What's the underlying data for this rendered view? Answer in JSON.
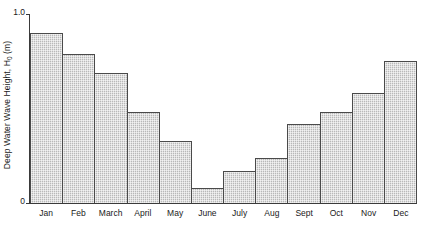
{
  "chart_data": {
    "type": "bar",
    "title": "",
    "xlabel": "",
    "ylabel": "Deep Water Wave Height, H",
    "ylabel_subscript": "0",
    "ylabel_units": " (m)",
    "categories": [
      "Jan",
      "Feb",
      "March",
      "April",
      "May",
      "June",
      "July",
      "Aug",
      "Sept",
      "Oct",
      "Nov",
      "Dec"
    ],
    "values": [
      0.9,
      0.79,
      0.69,
      0.48,
      0.33,
      0.08,
      0.17,
      0.24,
      0.42,
      0.48,
      0.58,
      0.75
    ],
    "ylim": [
      0,
      1.0
    ],
    "ytick_labels": [
      "1.0",
      "0"
    ],
    "ytick_values": [
      1.0,
      0
    ],
    "grid": false,
    "legend": false,
    "bar_fill_color": "#c4c4c4",
    "bar_border_color": "#4a4a4a",
    "axis_color": "#3a3a3a",
    "background_color": "#ffffff"
  }
}
